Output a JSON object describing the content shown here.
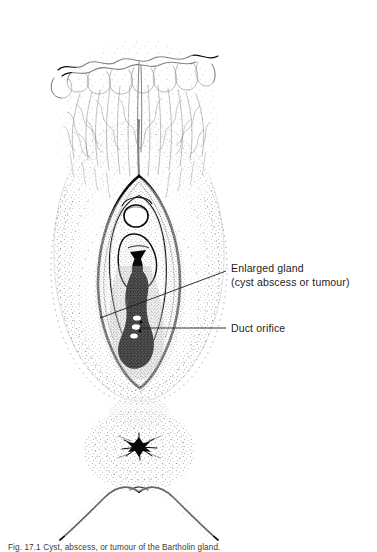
{
  "figure": {
    "background_color": "#ffffff",
    "ink_color": "#161616",
    "labels": [
      {
        "id": "enlarged-gland",
        "line1": "Enlarged gland",
        "line2": "(cyst abscess or tumour)",
        "leader": "diagonal"
      },
      {
        "id": "duct-orifice",
        "line1": "Duct orifice",
        "leader": "horizontal"
      }
    ],
    "caption": "Fig. 17.1  Cyst, abscess, or tumour of the Bartholin gland.",
    "parts": [
      "pubic-hair",
      "mons-pubis",
      "labium-majus-left",
      "labium-majus-right",
      "labium-minus",
      "clitoris",
      "urethral-orifice",
      "vaginal-introitus",
      "enlarged-gland-mass",
      "duct-orifice-openings",
      "perineum",
      "anus",
      "thigh-left",
      "thigh-right"
    ]
  }
}
